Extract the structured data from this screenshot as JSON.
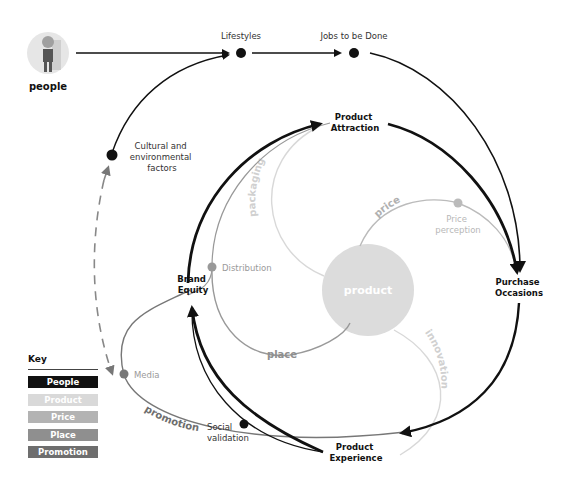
{
  "people": {
    "label": "people",
    "icon": "person-avatar"
  },
  "nodes": {
    "lifestyles": "Lifestyles",
    "jobs": "Jobs to be Done",
    "cultural": [
      "Cultural and",
      "environmental",
      "factors"
    ],
    "attraction": [
      "Product",
      "Attraction"
    ],
    "purchase": [
      "Purchase",
      "Occasions"
    ],
    "experience": [
      "Product",
      "Experience"
    ],
    "brand": [
      "Brand",
      "Equity"
    ],
    "product": "product",
    "distribution": "Distribution",
    "price_perception": [
      "Price",
      "perception"
    ],
    "media": "Media",
    "social": [
      "Social",
      "validation"
    ]
  },
  "arcs": {
    "packaging": "packaging",
    "price": "price",
    "place": "place",
    "innovation": "innovation",
    "promotion": "promotion"
  },
  "key": {
    "title": "Key",
    "items": [
      {
        "label": "People",
        "color": "#111111"
      },
      {
        "label": "Product",
        "color": "#d9d9d9"
      },
      {
        "label": "Price",
        "color": "#b3b3b3"
      },
      {
        "label": "Place",
        "color": "#8f8f8f"
      },
      {
        "label": "Promotion",
        "color": "#6e6e6e"
      }
    ]
  },
  "colors": {
    "people": "#111111",
    "product": "#d9d9d9",
    "price": "#b3b3b3",
    "place": "#8f8f8f",
    "promotion": "#6e6e6e"
  }
}
